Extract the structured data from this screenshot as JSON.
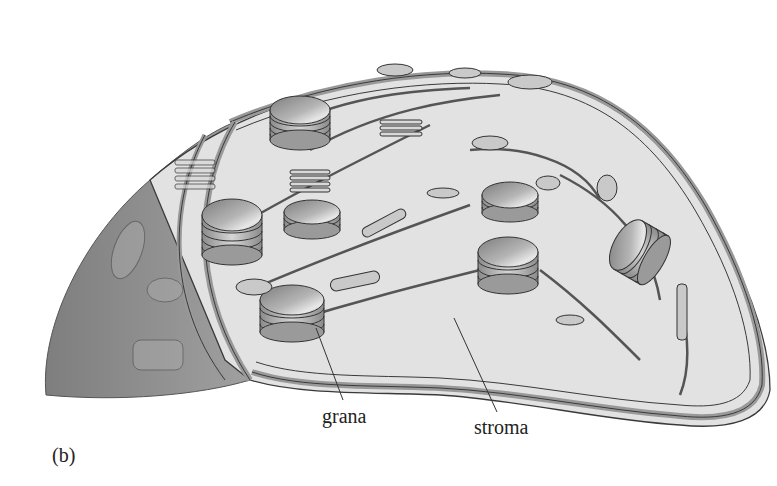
{
  "figure": {
    "panel_label": "(b)",
    "labels": [
      {
        "id": "grana",
        "text": "grana"
      },
      {
        "id": "stroma",
        "text": "stroma"
      }
    ],
    "colors": {
      "outer_shell": "#8e8e8e",
      "inner_fill": "#e3e3e3",
      "membrane": "#a9a9a9",
      "outline": "#3a3a3a",
      "disc_top": "#9a9a9a",
      "background": "#ffffff"
    }
  }
}
